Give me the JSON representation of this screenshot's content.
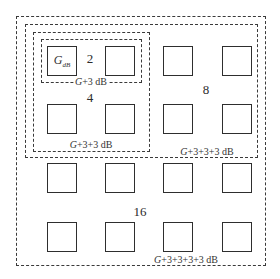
{
  "diagram": {
    "type": "antenna-array-gain-scaling",
    "groups": [
      {
        "id": "g16",
        "count_label": "16",
        "gain_label_prefix": "G",
        "gain_label_suffix": "+3+3+3+3 dB",
        "rect": [
          16,
          16,
          250,
          250
        ],
        "count_pos": [
          140,
          212
        ],
        "gain_pos": [
          186,
          260
        ]
      },
      {
        "id": "g8",
        "count_label": "8",
        "gain_label_prefix": "G",
        "gain_label_suffix": "+3+3+3 dB",
        "rect": [
          25,
          24,
          233,
          134
        ],
        "count_pos": [
          206,
          90
        ],
        "gain_pos": [
          207,
          152
        ]
      },
      {
        "id": "g4",
        "count_label": "4",
        "gain_label_prefix": "G",
        "gain_label_suffix": "+3+3 dB",
        "rect": [
          33,
          32,
          117,
          120
        ],
        "count_pos": [
          90,
          98
        ],
        "gain_pos": [
          91,
          145
        ]
      },
      {
        "id": "g2",
        "count_label": "2",
        "gain_label_prefix": "G",
        "gain_label_suffix": "+3 dB",
        "rect": [
          41,
          39,
          101,
          44
        ],
        "count_pos": [
          90,
          59
        ],
        "gain_pos": [
          91,
          82
        ]
      }
    ],
    "element_label": {
      "main": "G",
      "sub": "dB",
      "pos": [
        62,
        61
      ]
    },
    "elements": {
      "columns_x": [
        47,
        105,
        163,
        222
      ],
      "rows_y": [
        46,
        104,
        163,
        222
      ],
      "size": 30
    },
    "colors": {
      "line": "#2e2e2e",
      "dash": "#3a3a3a",
      "text": "#2b2b2b",
      "background": "#ffffff"
    }
  }
}
